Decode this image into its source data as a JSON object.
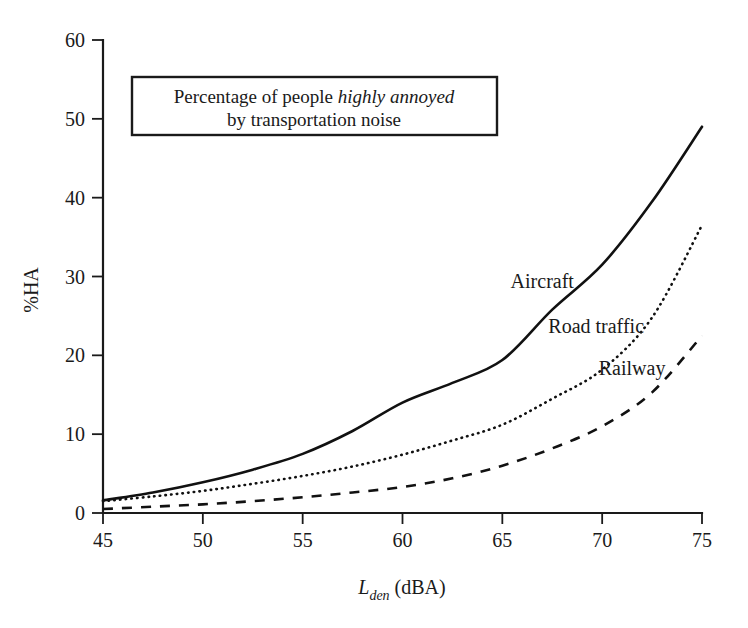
{
  "figure": {
    "title_line1_prefix": "Percentage of people ",
    "title_line1_italic": "highly annoyed",
    "title_line2": "by transportation noise"
  },
  "chart_data": {
    "type": "line",
    "title": "Percentage of people highly annoyed by transportation noise",
    "xlabel": "L_den (dBA)",
    "xlabel_main": "L",
    "xlabel_sub": "den",
    "xlabel_unit": " (dBA)",
    "ylabel": "%HA",
    "xlim": [
      45,
      75
    ],
    "ylim": [
      0,
      60
    ],
    "xticks": [
      45,
      50,
      55,
      60,
      65,
      70,
      75
    ],
    "yticks": [
      0,
      10,
      20,
      30,
      40,
      50,
      60
    ],
    "grid": false,
    "legend_position": "inline-annotations",
    "x": [
      45,
      47.5,
      50,
      52.5,
      55,
      57.5,
      60,
      62.5,
      65,
      67.5,
      70,
      72.5,
      75
    ],
    "series": [
      {
        "name": "Aircraft",
        "style": "solid",
        "label_x": 67.0,
        "label_y": 28.5,
        "values": [
          1.6,
          2.6,
          3.9,
          5.5,
          7.5,
          10.4,
          14.0,
          16.5,
          19.4,
          25.8,
          31.5,
          39.5,
          49.0
        ]
      },
      {
        "name": "Road traffic",
        "style": "dotted",
        "label_x": 69.7,
        "label_y": 22.8,
        "values": [
          1.5,
          2.1,
          2.8,
          3.7,
          4.7,
          5.9,
          7.4,
          9.2,
          11.2,
          14.5,
          18.2,
          24.8,
          36.5
        ]
      },
      {
        "name": "Railway",
        "style": "dashed",
        "label_x": 71.5,
        "label_y": 17.5,
        "values": [
          0.5,
          0.8,
          1.1,
          1.5,
          2.0,
          2.6,
          3.3,
          4.4,
          6.0,
          8.2,
          11.0,
          15.3,
          22.5
        ]
      }
    ]
  },
  "colors": {
    "line": "#111111",
    "axis": "#1a1a1a",
    "background": "#ffffff"
  }
}
